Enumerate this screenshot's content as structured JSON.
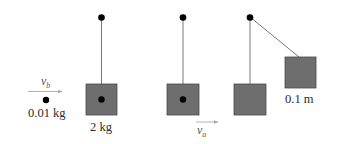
{
  "diagram": {
    "title": "",
    "colors": {
      "block_fill": "#6e6e6e",
      "block_stroke": "#4a4a4a",
      "string": "#7a7a7a",
      "pivot": "#000000",
      "bullet": "#000000",
      "arrow": "#a8a8a8",
      "text": "#2b2b2b"
    },
    "bullet": {
      "mass_label": "0.01 kg",
      "velocity_symbol": "v",
      "velocity_subscript": "b"
    },
    "stages": [
      {
        "name": "before-impact",
        "block_mass_label": "2 kg",
        "has_embedded_bullet": true
      },
      {
        "name": "after-impact",
        "has_embedded_bullet": true,
        "velocity_symbol": "v",
        "velocity_subscript": "a"
      },
      {
        "name": "rest-position",
        "has_embedded_bullet": false
      },
      {
        "name": "max-swing",
        "height_label": "0.1 m",
        "has_embedded_bullet": false
      }
    ]
  }
}
